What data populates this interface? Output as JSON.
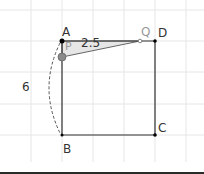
{
  "diagram": {
    "type": "geometry-construction",
    "grid": {
      "visible": true,
      "spacing_px": 31,
      "color": "#e6e6e6"
    },
    "points": [
      {
        "name": "A",
        "label": "A",
        "x": 62,
        "y": 41,
        "color": "#000000"
      },
      {
        "name": "B",
        "label": "B",
        "x": 62,
        "y": 135,
        "color": "#000000"
      },
      {
        "name": "C",
        "label": "C",
        "x": 155,
        "y": 135,
        "color": "#000000"
      },
      {
        "name": "D",
        "label": "D",
        "x": 155,
        "y": 41,
        "color": "#000000"
      },
      {
        "name": "P",
        "label": "P",
        "x": 62,
        "y": 57,
        "color": "#808080"
      },
      {
        "name": "Q",
        "label": "Q",
        "x": 140,
        "y": 41,
        "color": "#808080"
      }
    ],
    "labels": {
      "A": "A",
      "B": "B",
      "C": "C",
      "D": "D",
      "P": "P",
      "Q": "Q",
      "side_length": "6",
      "segment_length": "2.5"
    },
    "shapes": {
      "square": "ABCD",
      "triangle": "APQ",
      "arc": "dashed arc from A to B"
    },
    "colors": {
      "line": "#333333",
      "triangle_fill": "#e0e0e0",
      "moving_point": "#808080",
      "label": "#333333",
      "gray_label": "#999999"
    }
  }
}
